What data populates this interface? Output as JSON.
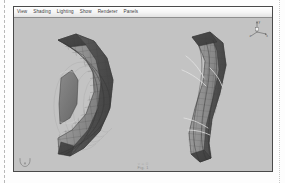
{
  "window": {
    "background_color": "#c3c3c3",
    "border_color": "#4a4a4a"
  },
  "menu_bar": {
    "items": [
      {
        "label": "View"
      },
      {
        "label": "Shading"
      },
      {
        "label": "Lighting"
      },
      {
        "label": "Show"
      },
      {
        "label": "Renderer"
      },
      {
        "label": "Panels"
      }
    ]
  },
  "viewport": {
    "background_color": "#c3c3c3",
    "caption_line_1": "v = 0",
    "caption_line_2": "Fig. 1",
    "axis_gizmo": {
      "label_y": "y",
      "label_x": "x",
      "label_z": "z",
      "color": "#6e6e6e"
    },
    "view_compass": {
      "label": "persp"
    }
  },
  "scene": {
    "shading_mode": "smooth-shaded-with-wireframe",
    "objects": [
      {
        "name": "curved-shell-left",
        "description": "C-shaped annular curved shell mesh, open on the left, quad wireframe",
        "fill_light": "#9a9a9a",
        "fill_dark": "#545454",
        "wire_color": "#3a3a3a"
      },
      {
        "name": "curved-shell-right",
        "description": "S-curved deformed shell mesh, quad wireframe",
        "fill_light": "#9a9a9a",
        "fill_dark": "#545454",
        "wire_color": "#3a3a3a"
      }
    ],
    "contour_rings": {
      "name": "concentric-contour-arcs",
      "color": "#b0b0b0",
      "count": 5
    },
    "highlight_streaks": {
      "name": "specular-highlight-streaks",
      "color": "#e8e8e8",
      "count": 5
    }
  },
  "page": {
    "sheet_color": "#fdfdfd",
    "crop_marks": [
      {
        "side": "left",
        "style": "dashed"
      },
      {
        "side": "right",
        "style": "dotted"
      }
    ]
  }
}
